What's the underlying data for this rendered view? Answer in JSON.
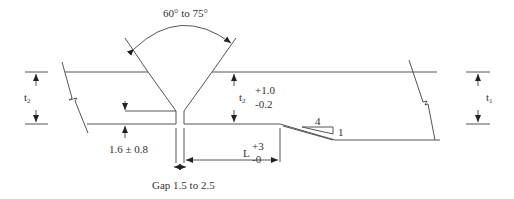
{
  "diagram": {
    "type": "weld joint preparation detail",
    "labels": {
      "angle": "60° to 75°",
      "t2_left": "t",
      "t2_left_sub": "2",
      "t2_mid": "t",
      "t2_mid_sub": "2",
      "t1_right": "t",
      "t1_right_sub": "1",
      "t2_tol_plus": "+1.0",
      "t2_tol_minus": "-0.2",
      "root_face": "1.6 ± 0.8",
      "L_label": "L",
      "L_tol_plus": "+3",
      "L_tol_minus": "-0",
      "slope_run": "4",
      "slope_rise": "1",
      "gap": "Gap 1.5 to 2.5"
    },
    "colors": {
      "line": "#555555",
      "text": "#333333"
    }
  }
}
